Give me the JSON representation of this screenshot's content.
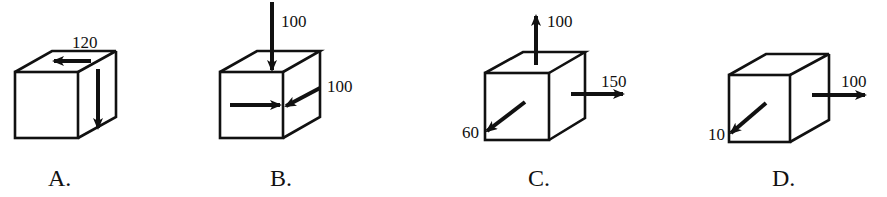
{
  "figure": {
    "options": [
      {
        "label": "A.",
        "forces": [
          {
            "value": "120",
            "direction": "left",
            "location": "top face"
          },
          {
            "value": "",
            "direction": "down",
            "location": "right face"
          }
        ]
      },
      {
        "label": "B.",
        "forces": [
          {
            "value": "100",
            "direction": "down",
            "location": "top edge"
          },
          {
            "value": "",
            "direction": "right",
            "location": "front face"
          },
          {
            "value": "100",
            "direction": "down-left (into right face)",
            "location": "right face"
          }
        ]
      },
      {
        "label": "C.",
        "forces": [
          {
            "value": "100",
            "direction": "up",
            "location": "top face"
          },
          {
            "value": "150",
            "direction": "right",
            "location": "right face"
          },
          {
            "value": "60",
            "direction": "down-left (out of front face)",
            "location": "front face"
          }
        ]
      },
      {
        "label": "D.",
        "forces": [
          {
            "value": "100",
            "direction": "right",
            "location": "right face"
          },
          {
            "value": "10",
            "direction": "down-left (out of front face)",
            "location": "front face"
          }
        ]
      }
    ]
  },
  "labels": {
    "a_value": "120",
    "b_top_value": "100",
    "b_side_value": "100",
    "c_top_value": "100",
    "c_right_value": "150",
    "c_front_value": "60",
    "d_right_value": "100",
    "d_front_value": "10",
    "opt_a": "A.",
    "opt_b": "B.",
    "opt_c": "C.",
    "opt_d": "D."
  },
  "colors": {
    "ink": "#111111",
    "background": "#ffffff"
  }
}
